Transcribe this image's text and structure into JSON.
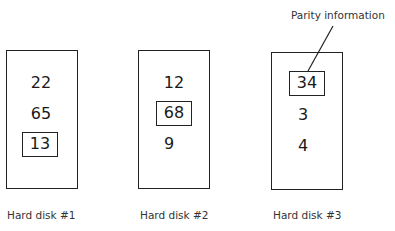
{
  "diagram": {
    "title": "",
    "annotation": {
      "label": "Parity information",
      "points_to": "Hard disk #3 block 34"
    },
    "disks": [
      {
        "label": "Hard disk #1",
        "blocks": [
          {
            "value": "22",
            "parity": false
          },
          {
            "value": "65",
            "parity": false
          },
          {
            "value": "13",
            "parity": true
          }
        ]
      },
      {
        "label": "Hard disk #2",
        "blocks": [
          {
            "value": "12",
            "parity": false
          },
          {
            "value": "68",
            "parity": true
          },
          {
            "value": "9",
            "parity": false
          }
        ]
      },
      {
        "label": "Hard disk #3",
        "blocks": [
          {
            "value": "34",
            "parity": true
          },
          {
            "value": "3",
            "parity": false
          },
          {
            "value": "4",
            "parity": false
          }
        ]
      }
    ],
    "colors": {
      "stroke": "#222222",
      "text": "#1a1a1a",
      "background": "#ffffff"
    }
  }
}
